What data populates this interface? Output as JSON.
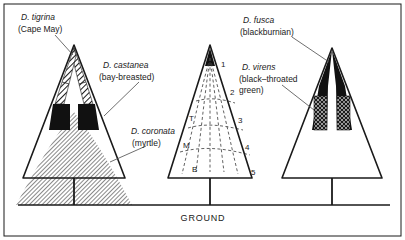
{
  "figure": {
    "ground_label": "GROUND",
    "border_color": "#1a1a1a",
    "ink_color": "#1a1a1a",
    "shade_color": "#8c8c8c"
  },
  "species": [
    {
      "id": "tigrina",
      "latin": "D. tigrina",
      "common": "(Cape May)",
      "tree": "left",
      "fill": "diagonal-hatch",
      "zone": "upper outer canopy"
    },
    {
      "id": "castanea",
      "latin": "D. castanea",
      "common": "(bay-breasted)",
      "tree": "left",
      "fill": "solid-black",
      "zone": "middle canopy"
    },
    {
      "id": "coronata",
      "latin": "D. coronata",
      "common": "(myrtle)",
      "tree": "left",
      "fill": "dense-hatch",
      "zone": "lower canopy and ground"
    },
    {
      "id": "fusca",
      "latin": "D. fusca",
      "common": "(blackburnian)",
      "tree": "right",
      "fill": "solid-black",
      "zone": "upper canopy"
    },
    {
      "id": "virens",
      "latin": "D. virens",
      "common": "(black-throated green)",
      "tree": "right",
      "fill": "cross-hatch",
      "zone": "upper-middle interior"
    }
  ],
  "zone_diagram": {
    "tree": "middle",
    "height_zones": [
      "1",
      "2",
      "3",
      "4",
      "5"
    ],
    "branch_zones": [
      "T",
      "M",
      "B"
    ],
    "branch_zone_names": [
      "Tip",
      "Middle",
      "Base"
    ],
    "style": "dashed"
  }
}
